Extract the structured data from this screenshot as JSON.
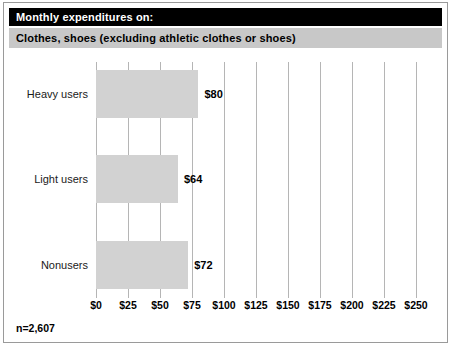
{
  "header": {
    "title": "Monthly expenditures on:",
    "subtitle": "Clothes, shoes (excluding athletic clothes or shoes)",
    "title_bg": "#000000",
    "title_fg": "#ffffff",
    "subtitle_bg": "#c8c8c8",
    "subtitle_fg": "#000000"
  },
  "footnote": "n=2,607",
  "chart_data": {
    "type": "bar",
    "orientation": "horizontal",
    "title": "Monthly expenditures on:",
    "subtitle": "Clothes, shoes (excluding athletic clothes or shoes)",
    "categories": [
      "Heavy users",
      "Light users",
      "Nonusers"
    ],
    "values": [
      80,
      64,
      72
    ],
    "value_labels": [
      "$80",
      "$64",
      "$72"
    ],
    "xlabel": "",
    "ylabel": "",
    "xlim": [
      0,
      250
    ],
    "xticks": [
      0,
      25,
      50,
      75,
      100,
      125,
      150,
      175,
      200,
      225,
      250
    ],
    "xtick_labels": [
      "$0",
      "$25",
      "$50",
      "$75",
      "$100",
      "$125",
      "$150",
      "$175",
      "$200",
      "$225",
      "$250"
    ],
    "grid": true,
    "grid_axis": "x",
    "legend": false,
    "bar_color": "#d2d2d2",
    "gridline_color": "#b5b5b5",
    "note": "n=2,607"
  }
}
